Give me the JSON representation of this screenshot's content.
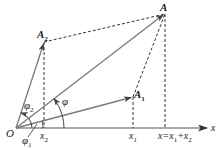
{
  "diagram": {
    "colors": {
      "line": "#7a7a7a",
      "dashed": "#333333",
      "axis": "#555555",
      "text": "#222222"
    },
    "origin": {
      "label": "O",
      "x": 16,
      "y": 128
    },
    "axis": {
      "label": "x",
      "x_end": 208
    },
    "points": {
      "A": {
        "label": "A",
        "x": 165,
        "y": 13
      },
      "A1": {
        "label": "A",
        "sub": "1",
        "x": 133,
        "y": 97
      },
      "A2": {
        "label": "A",
        "sub": "2",
        "x": 44,
        "y": 42
      }
    },
    "angles": {
      "phi": {
        "label": "φ"
      },
      "phi1": {
        "label": "φ",
        "sub": "1"
      },
      "phi2": {
        "label": "φ",
        "sub": "2"
      }
    },
    "ticks": {
      "x1": {
        "label": "x",
        "sub": "1"
      },
      "x2": {
        "label": "x",
        "sub": "2"
      },
      "x_sum": {
        "label": "x=x",
        "sub_a": "1",
        "mid": "+x",
        "sub_b": "2"
      }
    }
  }
}
